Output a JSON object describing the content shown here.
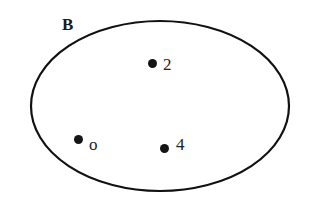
{
  "diagram": {
    "type": "venn-single-set",
    "background_color": "#ffffff",
    "stroke_color": "#111111",
    "dot_color": "#151515",
    "text_color": "#1a1a1a",
    "set": {
      "label": "B",
      "label_position": {
        "x": 62,
        "y": 16
      },
      "shape": "ellipse",
      "center": {
        "x": 160,
        "y": 106
      },
      "radius_x": 129,
      "radius_y": 85,
      "stroke_width": 2.2,
      "fill": "none"
    },
    "members": [
      {
        "label": "2",
        "dot": {
          "x": 148,
          "y": 59
        },
        "label_position": {
          "x": 163,
          "y": 56
        }
      },
      {
        "label": "o",
        "dot": {
          "x": 74,
          "y": 135
        },
        "label_position": {
          "x": 89,
          "y": 136
        }
      },
      {
        "label": "4",
        "dot": {
          "x": 160,
          "y": 144
        },
        "label_position": {
          "x": 176,
          "y": 136
        }
      }
    ]
  }
}
